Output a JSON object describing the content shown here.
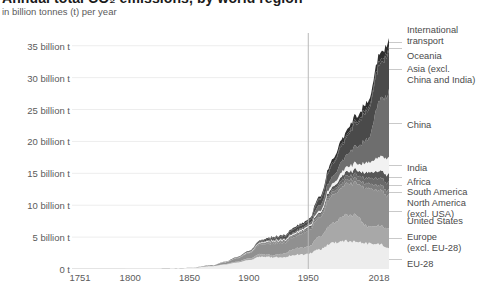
{
  "header": {
    "title": "Annual total CO₂ emissions, by world region",
    "subtitle": "in billion tonnes (t) per year"
  },
  "axes": {
    "y_ticks": [
      "35 billion t",
      "30 billion t",
      "25 billion t",
      "20 billion t",
      "15 billion t",
      "10 billion t",
      "5 billion t",
      "0 t"
    ],
    "x_ticks": [
      "1751",
      "1800",
      "1850",
      "1900",
      "1950",
      "2018"
    ]
  },
  "colors": {
    "background": "#ffffff",
    "text": "#5b5b5b",
    "gridline": "#ededed",
    "marker_line": "#b8b8b8",
    "legend_rule": "#c9c9c9"
  },
  "legend": {
    "items": [
      {
        "label": "International\ntransport",
        "color": "#2f2f2f"
      },
      {
        "label": "Oceania",
        "color": "#3d3d3d"
      },
      {
        "label": "Asia (excl.\nChina and India)",
        "color": "#4a4a4a"
      },
      {
        "label": "China",
        "color": "#6e6e6e"
      },
      {
        "label": "India",
        "color": "#f2f2f2"
      },
      {
        "label": "Africa",
        "color": "#575757"
      },
      {
        "label": "South America",
        "color": "#6a6a6a"
      },
      {
        "label": "North America\n(excl. USA)",
        "color": "#7d7d7d"
      },
      {
        "label": "United States",
        "color": "#909090"
      },
      {
        "label": "Europe\n(excl. EU-28)",
        "color": "#a8a8a8"
      },
      {
        "label": "EU-28",
        "color": "#ededed"
      }
    ]
  },
  "chart_data": {
    "type": "area",
    "stacked": true,
    "title": "Annual total CO₂ emissions, by world region",
    "subtitle": "in billion tonnes (t) per year",
    "xlabel": "",
    "ylabel": "in billion tonnes (t) per year",
    "xlim": [
      1751,
      2018
    ],
    "ylim": [
      0,
      37
    ],
    "grid": true,
    "legend_position": "right",
    "annotations": [
      {
        "type": "vline",
        "x": 1950,
        "color": "#b8b8b8"
      }
    ],
    "x": [
      1751,
      1800,
      1830,
      1850,
      1870,
      1880,
      1890,
      1900,
      1910,
      1920,
      1930,
      1940,
      1950,
      1960,
      1970,
      1980,
      1990,
      2000,
      2010,
      2018
    ],
    "series": [
      {
        "name": "EU-28",
        "values": [
          0.0,
          0.02,
          0.05,
          0.15,
          0.45,
          0.7,
          1.0,
          1.4,
          1.9,
          1.85,
          1.9,
          2.2,
          2.4,
          3.1,
          4.1,
          4.4,
          4.3,
          4.0,
          3.9,
          3.4
        ]
      },
      {
        "name": "Europe (excl. EU-28)",
        "values": [
          0.0,
          0.0,
          0.0,
          0.01,
          0.04,
          0.08,
          0.15,
          0.25,
          0.4,
          0.3,
          0.6,
          1.0,
          1.1,
          2.0,
          3.0,
          4.0,
          4.2,
          2.6,
          2.9,
          3.0
        ]
      },
      {
        "name": "United States",
        "values": [
          0.0,
          0.0,
          0.01,
          0.02,
          0.1,
          0.25,
          0.5,
          0.8,
          1.5,
          1.8,
          1.7,
          1.9,
          2.5,
          3.0,
          4.4,
          4.8,
          5.1,
          5.9,
          5.6,
          5.1
        ]
      },
      {
        "name": "North America (excl. USA)",
        "values": [
          0.0,
          0.0,
          0.0,
          0.0,
          0.01,
          0.02,
          0.04,
          0.07,
          0.15,
          0.2,
          0.2,
          0.22,
          0.25,
          0.3,
          0.45,
          0.6,
          0.65,
          0.75,
          0.8,
          0.8
        ]
      },
      {
        "name": "South America",
        "values": [
          0.0,
          0.0,
          0.0,
          0.0,
          0.0,
          0.01,
          0.02,
          0.03,
          0.05,
          0.07,
          0.08,
          0.1,
          0.13,
          0.2,
          0.35,
          0.55,
          0.65,
          0.85,
          1.1,
          1.2
        ]
      },
      {
        "name": "Africa",
        "values": [
          0.0,
          0.0,
          0.0,
          0.0,
          0.0,
          0.01,
          0.02,
          0.03,
          0.05,
          0.08,
          0.1,
          0.13,
          0.18,
          0.28,
          0.45,
          0.65,
          0.75,
          0.9,
          1.15,
          1.35
        ]
      },
      {
        "name": "India",
        "values": [
          0.0,
          0.0,
          0.0,
          0.0,
          0.01,
          0.02,
          0.04,
          0.06,
          0.09,
          0.12,
          0.14,
          0.18,
          0.2,
          0.32,
          0.5,
          0.7,
          1.0,
          1.5,
          2.2,
          2.6
        ]
      },
      {
        "name": "China",
        "values": [
          0.0,
          0.0,
          0.0,
          0.0,
          0.01,
          0.02,
          0.03,
          0.05,
          0.08,
          0.12,
          0.15,
          0.2,
          0.25,
          0.9,
          1.1,
          1.7,
          2.7,
          3.6,
          8.8,
          10.2
        ]
      },
      {
        "name": "Asia (excl. China and India)",
        "values": [
          0.0,
          0.0,
          0.0,
          0.0,
          0.01,
          0.02,
          0.04,
          0.08,
          0.15,
          0.25,
          0.35,
          0.5,
          0.45,
          0.9,
          1.9,
          2.6,
          3.6,
          4.4,
          5.6,
          6.3
        ]
      },
      {
        "name": "Oceania",
        "values": [
          0.0,
          0.0,
          0.0,
          0.0,
          0.0,
          0.01,
          0.02,
          0.03,
          0.05,
          0.06,
          0.07,
          0.08,
          0.1,
          0.15,
          0.25,
          0.32,
          0.38,
          0.46,
          0.55,
          0.55
        ]
      },
      {
        "name": "International transport",
        "values": [
          0.0,
          0.0,
          0.0,
          0.0,
          0.0,
          0.01,
          0.02,
          0.04,
          0.08,
          0.12,
          0.15,
          0.18,
          0.2,
          0.3,
          0.55,
          0.7,
          0.8,
          0.95,
          1.1,
          1.25
        ]
      }
    ],
    "total_2018": 36.6
  }
}
